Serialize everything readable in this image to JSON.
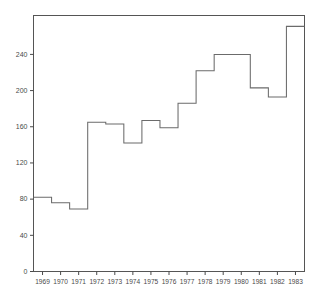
{
  "chart_data": {
    "type": "line",
    "subtype": "step",
    "title": "",
    "subtitle": "",
    "xlabel": "",
    "ylabel": "",
    "categories": [
      "1969",
      "1970",
      "1971",
      "1972",
      "1973",
      "1974",
      "1975",
      "1976",
      "1977",
      "1978",
      "1979",
      "1980",
      "1981",
      "1982",
      "1983"
    ],
    "x": [
      1969,
      1970,
      1971,
      1972,
      1973,
      1974,
      1975,
      1976,
      1977,
      1978,
      1979,
      1980,
      1981,
      1982,
      1983
    ],
    "values": [
      82,
      76,
      69,
      165,
      163,
      142,
      167,
      159,
      186,
      222,
      240,
      240,
      203,
      193,
      271
    ],
    "series": [
      {
        "name": "",
        "values": [
          82,
          76,
          69,
          165,
          163,
          142,
          167,
          159,
          186,
          222,
          240,
          240,
          203,
          193,
          271
        ]
      }
    ],
    "xlim": [
      1968.5,
      1983.5
    ],
    "ylim": [
      0,
      283
    ],
    "yticks": [
      0,
      40,
      80,
      120,
      160,
      200,
      240
    ],
    "ytick_labels": [
      "0",
      "40",
      "80",
      "120",
      "160",
      "200",
      "240"
    ],
    "xtick_labels": [
      "1969",
      "1970",
      "1971",
      "1972",
      "1973",
      "1974",
      "1975",
      "1976",
      "1977",
      "1978",
      "1979",
      "1980",
      "1981",
      "1982",
      "1983"
    ],
    "grid": false,
    "legend": false,
    "legend_position": "none",
    "annotations": [],
    "colors": {
      "line": "#6b6b6b",
      "axis": "#4a4a4a",
      "frame": "#555555",
      "background": "#ffffff",
      "text": "#4a4a4a"
    }
  }
}
